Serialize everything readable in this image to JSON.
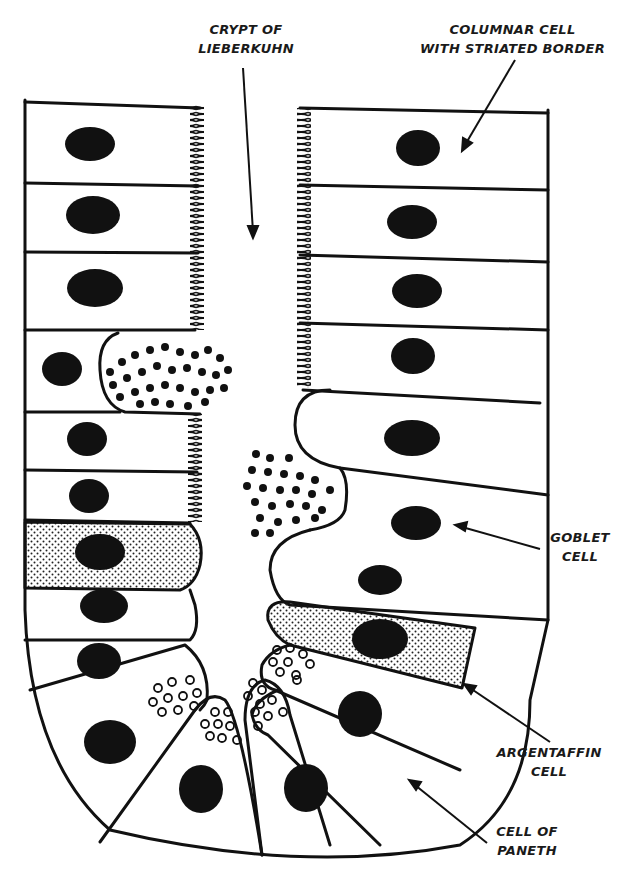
{
  "diagram": {
    "line_color": "#111111",
    "background": "#ffffff",
    "labels": {
      "crypt": {
        "line1": "CRYPT OF",
        "line2": "LIEBERKUHN"
      },
      "columnar": {
        "line1": "COLUMNAR CELL",
        "line2": "WITH STRIATED BORDER"
      },
      "goblet": {
        "line1": "GOBLET",
        "line2": "CELL"
      },
      "argentaffin": {
        "line1": "ARGENTAFFIN",
        "line2": "CELL"
      },
      "paneth": {
        "line1": "CELL OF",
        "line2": "PANETH"
      }
    }
  }
}
